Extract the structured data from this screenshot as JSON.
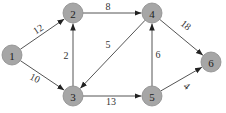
{
  "graph": {
    "type": "directed-weighted",
    "node_color": "#a6a6a6",
    "edge_color": "#555555",
    "nodes": [
      {
        "id": "1",
        "label": "1",
        "x": 12,
        "y": 55
      },
      {
        "id": "2",
        "label": "2",
        "x": 73,
        "y": 13
      },
      {
        "id": "3",
        "label": "3",
        "x": 73,
        "y": 96
      },
      {
        "id": "4",
        "label": "4",
        "x": 152,
        "y": 13
      },
      {
        "id": "5",
        "label": "5",
        "x": 152,
        "y": 96
      },
      {
        "id": "6",
        "label": "6",
        "x": 211,
        "y": 62
      }
    ],
    "edges": [
      {
        "from": "1",
        "to": "2",
        "weight": "12",
        "lx": 38,
        "ly": 29,
        "rot": -33
      },
      {
        "from": "1",
        "to": "3",
        "weight": "10",
        "lx": 35,
        "ly": 78,
        "rot": 27
      },
      {
        "from": "2",
        "to": "4",
        "weight": "8",
        "lx": 108,
        "ly": 6,
        "rot": 0
      },
      {
        "from": "3",
        "to": "2",
        "weight": "2",
        "lx": 66,
        "ly": 55,
        "rot": 0
      },
      {
        "from": "4",
        "to": "3",
        "weight": "5",
        "lx": 108,
        "ly": 44,
        "rot": 0
      },
      {
        "from": "3",
        "to": "5",
        "weight": "13",
        "lx": 111,
        "ly": 101,
        "rot": 0
      },
      {
        "from": "5",
        "to": "4",
        "weight": "6",
        "lx": 158,
        "ly": 54,
        "rot": 0
      },
      {
        "from": "4",
        "to": "6",
        "weight": "18",
        "lx": 186,
        "ly": 25,
        "rot": 38
      },
      {
        "from": "5",
        "to": "6",
        "weight": "4",
        "lx": 187,
        "ly": 86,
        "rot": 40
      }
    ]
  }
}
